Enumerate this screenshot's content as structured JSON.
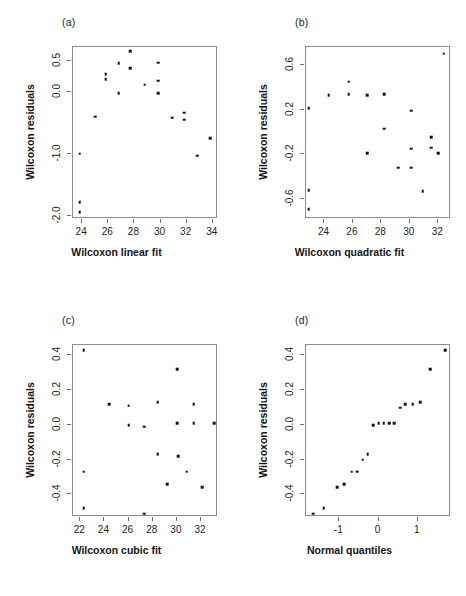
{
  "figure": {
    "layout": "2x2 grid of residual diagnostic scatter plots",
    "background_color": "#ffffff",
    "point_color": "#111111",
    "frame_color": "#8d8d8d"
  },
  "panels": [
    {
      "tag": "(a)",
      "xlabel": "Wilcoxon linear fit",
      "ylabel": "Wilcoxon residuals",
      "xticks": [
        "24",
        "26",
        "28",
        "30",
        "32",
        "34"
      ],
      "yticks": [
        "0.5",
        "0.0",
        "-1.0",
        "-2.0"
      ]
    },
    {
      "tag": "(b)",
      "xlabel": "Wilcoxon quadratic fit",
      "ylabel": "Wilcoxon residuals",
      "xticks": [
        "24",
        "26",
        "28",
        "30",
        "32"
      ],
      "yticks": [
        "0.6",
        "0.2",
        "-0.2",
        "-0.6"
      ]
    },
    {
      "tag": "(c)",
      "xlabel": "Wilcoxon cubic fit",
      "ylabel": "Wilcoxon residuals",
      "xticks": [
        "22",
        "24",
        "26",
        "28",
        "30",
        "32"
      ],
      "yticks": [
        "0.4",
        "0.2",
        "0.0",
        "-0.2",
        "-0.4"
      ]
    },
    {
      "tag": "(d)",
      "xlabel": "Normal quantiles",
      "ylabel": "Wilcoxon residuals",
      "xticks": [
        "-1",
        "0",
        "1"
      ],
      "yticks": [
        "0.4",
        "0.2",
        "0.0",
        "-0.2",
        "-0.4"
      ]
    }
  ],
  "chart_data": [
    {
      "type": "scatter",
      "panel": "(a)",
      "title": "(a)",
      "xlabel": "Wilcoxon linear fit",
      "ylabel": "Wilcoxon residuals",
      "xlim": [
        23.3,
        34.4
      ],
      "ylim": [
        -2.05,
        0.72
      ],
      "xticks": [
        24,
        26,
        28,
        30,
        32,
        34
      ],
      "yticks": [
        0.5,
        0.0,
        -1.0,
        -2.0
      ],
      "grid": false,
      "legend": null,
      "x": [
        23.8,
        23.8,
        23.8,
        25.0,
        25.8,
        25.8,
        26.8,
        26.8,
        27.7,
        27.7,
        28.8,
        29.8,
        29.8,
        29.8,
        30.9,
        31.8,
        31.8,
        32.8,
        33.8
      ],
      "y": [
        -1.0,
        -1.78,
        -1.94,
        -0.4,
        0.28,
        0.2,
        0.46,
        -0.02,
        0.65,
        0.38,
        0.11,
        0.47,
        0.18,
        -0.02,
        -0.42,
        -0.34,
        -0.45,
        -1.03,
        -0.75
      ]
    },
    {
      "type": "scatter",
      "panel": "(b)",
      "title": "(b)",
      "xlabel": "Wilcoxon quadratic fit",
      "ylabel": "Wilcoxon residuals",
      "xlim": [
        22.7,
        32.9
      ],
      "ylim": [
        -0.78,
        0.76
      ],
      "xticks": [
        24,
        26,
        28,
        30,
        32
      ],
      "yticks": [
        0.6,
        0.2,
        -0.2,
        -0.6
      ],
      "grid": false,
      "legend": null,
      "x": [
        22.9,
        22.9,
        22.9,
        24.3,
        25.7,
        25.7,
        27.0,
        27.0,
        28.2,
        28.2,
        29.2,
        30.1,
        30.1,
        30.1,
        30.9,
        31.5,
        31.5,
        32.0,
        32.4
      ],
      "y": [
        0.21,
        -0.52,
        -0.69,
        0.33,
        0.45,
        0.34,
        0.33,
        -0.19,
        0.34,
        0.03,
        -0.32,
        0.19,
        -0.15,
        -0.32,
        -0.53,
        -0.05,
        -0.14,
        -0.19,
        0.7
      ]
    },
    {
      "type": "scatter",
      "panel": "(c)",
      "title": "(c)",
      "xlabel": "Wilcoxon cubic fit",
      "ylabel": "Wilcoxon residuals",
      "xlim": [
        21.4,
        33.4
      ],
      "ylim": [
        -0.53,
        0.46
      ],
      "xticks": [
        22,
        24,
        26,
        28,
        30,
        32
      ],
      "yticks": [
        0.4,
        0.2,
        0.0,
        -0.2,
        -0.4
      ],
      "grid": false,
      "legend": null,
      "x": [
        22.3,
        22.3,
        22.3,
        24.4,
        26.0,
        26.0,
        27.3,
        27.3,
        28.4,
        28.4,
        29.2,
        30.0,
        30.0,
        30.1,
        30.8,
        31.4,
        31.4,
        32.1,
        33.1
      ],
      "y": [
        0.43,
        -0.27,
        -0.48,
        0.12,
        0.11,
        0.0,
        -0.01,
        -0.51,
        0.13,
        -0.17,
        -0.34,
        0.32,
        0.01,
        -0.18,
        -0.27,
        0.12,
        0.01,
        -0.36,
        0.01
      ]
    },
    {
      "type": "scatter",
      "panel": "(d)",
      "title": "(d)",
      "xlabel": "Normal quantiles",
      "ylabel": "Wilcoxon residuals",
      "xlim": [
        -1.85,
        1.85
      ],
      "ylim": [
        -0.53,
        0.46
      ],
      "xticks": [
        -1,
        0,
        1
      ],
      "yticks": [
        0.4,
        0.2,
        0.0,
        -0.2,
        -0.4
      ],
      "grid": false,
      "legend": null,
      "x": [
        -1.67,
        -1.4,
        -1.06,
        -0.87,
        -0.68,
        -0.55,
        -0.4,
        -0.28,
        -0.13,
        0.0,
        0.13,
        0.28,
        0.4,
        0.55,
        0.68,
        0.87,
        1.06,
        1.32,
        1.7
      ],
      "y": [
        -0.51,
        -0.48,
        -0.36,
        -0.34,
        -0.27,
        -0.27,
        -0.2,
        -0.17,
        0.0,
        0.01,
        0.01,
        0.01,
        0.01,
        0.1,
        0.12,
        0.12,
        0.13,
        0.32,
        0.43
      ]
    }
  ]
}
